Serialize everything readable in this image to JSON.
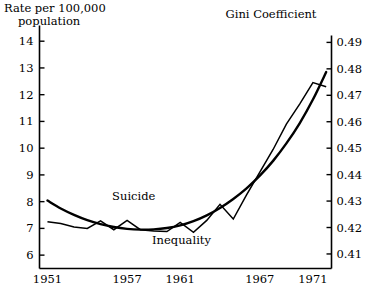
{
  "chart_data": {
    "type": "line",
    "title": "",
    "left_axis": {
      "label_line1": "Rate per 100,000",
      "label_line2": "population",
      "ticks": [
        "14",
        "13",
        "12",
        "11",
        "10",
        "9",
        "8",
        "7",
        "6"
      ],
      "values": [
        14,
        13,
        12,
        11,
        10,
        9,
        8,
        7,
        6
      ],
      "ylim": [
        5.5,
        14.4
      ]
    },
    "right_axis": {
      "label": "Gini Coefficient",
      "ticks": [
        "0.49",
        "0.48",
        "0.47",
        "0.46",
        "0.45",
        "0.44",
        "0.43",
        "0.42",
        "0.41"
      ],
      "values": [
        0.49,
        0.48,
        0.47,
        0.46,
        0.45,
        0.44,
        0.43,
        0.42,
        0.41
      ],
      "ylim": [
        0.4045,
        0.4945
      ]
    },
    "x_axis": {
      "label": "",
      "tick_labels": [
        "1951",
        "1957",
        "1961",
        "1967",
        "1971"
      ],
      "tick_values": [
        1951,
        1957,
        1961,
        1967,
        1971
      ],
      "xlim": [
        1950.4,
        1972.4
      ]
    },
    "grid": false,
    "legend_position": "inline-annotations",
    "series": [
      {
        "name": "Suicide",
        "axis": "left",
        "annotation": "Suicide",
        "annotation_x": 1957.5,
        "annotation_y": 8.05,
        "x": [
          1951,
          1952,
          1953,
          1954,
          1955,
          1956,
          1957,
          1958,
          1959,
          1960,
          1961,
          1962,
          1963,
          1964,
          1965,
          1966,
          1967,
          1968,
          1969,
          1970,
          1971,
          1972
        ],
        "values": [
          7.25,
          7.18,
          7.05,
          7.0,
          7.28,
          6.95,
          7.3,
          6.95,
          6.9,
          6.88,
          7.22,
          6.85,
          7.3,
          7.9,
          7.35,
          8.25,
          9.1,
          9.95,
          10.9,
          11.65,
          12.45,
          12.3
        ]
      },
      {
        "name": "Inequality",
        "axis": "right",
        "annotation": "Inequality",
        "annotation_x": 1961.1,
        "annotation_y": 0.4138,
        "x": [
          1951,
          1952,
          1953,
          1954,
          1955,
          1956,
          1957,
          1958,
          1959,
          1960,
          1961,
          1962,
          1963,
          1964,
          1965,
          1966,
          1967,
          1968,
          1969,
          1970,
          1971,
          1972
        ],
        "values": [
          0.4302,
          0.4272,
          0.4248,
          0.4228,
          0.4213,
          0.4202,
          0.4195,
          0.4192,
          0.4193,
          0.4198,
          0.4208,
          0.4224,
          0.4246,
          0.4274,
          0.4308,
          0.4348,
          0.4396,
          0.4452,
          0.4518,
          0.4594,
          0.4684,
          0.4788
        ]
      }
    ]
  }
}
